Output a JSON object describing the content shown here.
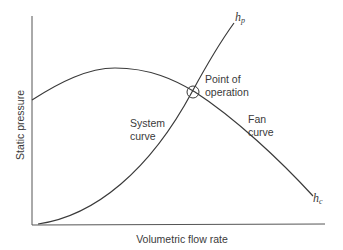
{
  "diagram": {
    "type": "fan-system-curve",
    "axes": {
      "y_label": "Static pressure",
      "x_label": "Volumetric flow rate"
    },
    "curves": {
      "system": {
        "label_line1": "System",
        "label_line2": "curve",
        "end_symbol": "h",
        "end_subscript": "p"
      },
      "fan": {
        "label_line1": "Fan",
        "label_line2": "curve",
        "end_symbol": "h",
        "end_subscript": "c"
      }
    },
    "operating_point": {
      "label_line1": "Point of",
      "label_line2": "operation"
    },
    "colors": {
      "line": "#3a3a3a",
      "text": "#3a3a3a",
      "background": "#ffffff"
    }
  }
}
